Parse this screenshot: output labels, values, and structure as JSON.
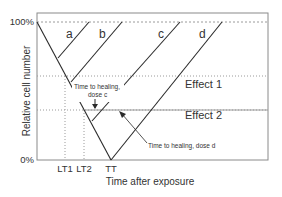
{
  "diagram": {
    "y_axis": {
      "label": "Relative cell number",
      "ticks": [
        "100%",
        "0%"
      ]
    },
    "x_axis": {
      "label": "Time after exposure",
      "ticks": [
        "LT1",
        "LT2",
        "TT"
      ]
    },
    "curves": [
      "a",
      "b",
      "c",
      "d"
    ],
    "thresholds": [
      {
        "label": "Effect 1"
      },
      {
        "label": "Effect 2"
      }
    ],
    "annotations": {
      "healing_c_line1": "Time to healing,",
      "healing_c_line2": "dose c",
      "healing_d": "Time to healing, dose d"
    },
    "colors": {
      "line": "#2a2a2a",
      "frame": "#8a8a8a",
      "dashed": "#9a9a9a",
      "effect2_line": "#9a9a9a"
    }
  }
}
